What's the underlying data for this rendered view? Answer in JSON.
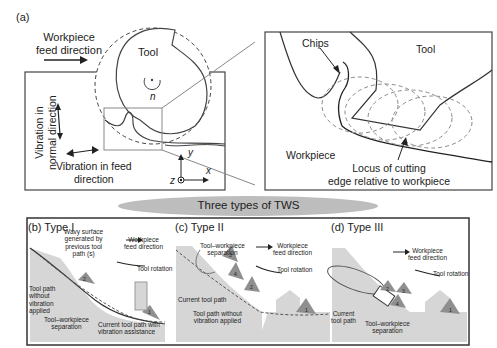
{
  "panel_a": {
    "label": "(a)",
    "feed_label_line1": "Workpiece",
    "feed_label_line2": "feed direction",
    "tool_label": "Tool",
    "rotation_symbol": "n",
    "vib_normal_line1": "Vibration in",
    "vib_normal_line2": "normal direction",
    "vib_feed_line1": "Vibration in feed",
    "vib_feed_line2": "direction",
    "axis_x": "x",
    "axis_y": "y",
    "axis_z": "z"
  },
  "panel_zoom": {
    "chips_label": "Chips",
    "tool_label": "Tool",
    "workpiece_label": "Workpiece",
    "locus_line1": "Locus of cutting",
    "locus_line2": "edge relative to workpiece"
  },
  "banner": {
    "title": "Three types of TWS"
  },
  "panel_b": {
    "label": "(b) Type I",
    "wavy_line1": "Wavy surface",
    "wavy_line2": "generated by",
    "wavy_line3": "previous tool",
    "wavy_line4": "path (s)",
    "feed_line1": "Workpiece",
    "feed_line2": "feed direction",
    "rotation": "Tool rotation",
    "no_vib_line1": "Tool path",
    "no_vib_line2": "without",
    "no_vib_line3": "vibration",
    "no_vib_line4": "applied",
    "sep_line1": "Tool–workpiece",
    "sep_line2": "separation",
    "current_line1": "Current tool path with",
    "current_line2": "vibration assistance",
    "teeth": [
      "1",
      "2"
    ]
  },
  "panel_c": {
    "label": "(c)  Type II",
    "sep_line1": "Tool–workpiece",
    "sep_line2": "separation",
    "feed_line1": "Workpiece",
    "feed_line2": "feed direction",
    "rotation": "Tool rotation",
    "current": "Current tool path",
    "no_vib_line1": "Tool path without",
    "no_vib_line2": "vibration applied",
    "teeth": [
      "1",
      "2",
      "3",
      "4"
    ]
  },
  "panel_d": {
    "label": "(d)  Type III",
    "feed_line1": "Workpiece",
    "feed_line2": "feed direction",
    "rotation": "Tool rotation",
    "current_line1": "Current",
    "current_line2": "tool path",
    "sep_line1": "Tool–workpiece",
    "sep_line2": "separation",
    "teeth": [
      "1",
      "2",
      "3",
      "4"
    ]
  },
  "colors": {
    "line": "#333333",
    "gray_line": "#8a8a8a",
    "workpiece_fill": "#d6d6d6",
    "tooth_fill": "#8f8f8f",
    "banner": "#bdbdbd"
  }
}
